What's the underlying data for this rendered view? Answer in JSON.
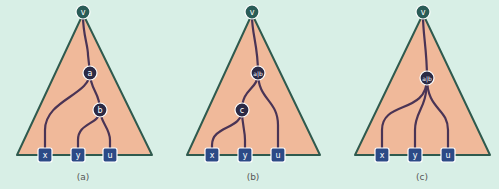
{
  "panels": [
    {
      "caption": "(a)",
      "root": "v",
      "internal_nodes": [
        "a",
        "b"
      ],
      "leaves": [
        "x",
        "y",
        "u"
      ]
    },
    {
      "caption": "(b)",
      "root": "v",
      "internal_nodes": [
        "a|b",
        "c"
      ],
      "leaves": [
        "x",
        "y",
        "u"
      ]
    },
    {
      "caption": "(c)",
      "root": "v",
      "internal_nodes": [
        "a|b"
      ],
      "leaves": [
        "x",
        "y",
        "u"
      ]
    }
  ],
  "colors": {
    "background": "#d8efe6",
    "triangle_fill": "#f0b99a",
    "triangle_stroke": "#2f5a4e",
    "edge": "#4a3455",
    "root_node": "#2a5c57",
    "internal_node": "#2b2a45",
    "leaf_node": "#2c4a86"
  }
}
